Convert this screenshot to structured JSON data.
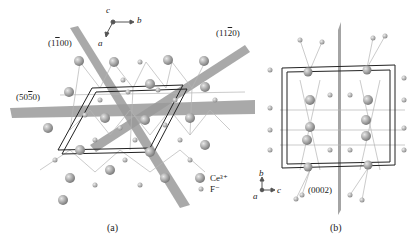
{
  "panel_a": {
    "caption": "(a)",
    "axes": {
      "c": "c",
      "b": "b",
      "a": "a"
    },
    "planes": [
      "(1̅100)",
      "(11̅2̅0)",
      "(505̅0)"
    ],
    "plane_labels": {
      "p1": "(11̅0 0)",
      "p2": "(112̅0)",
      "p3": "(505̅0)"
    },
    "legend": [
      {
        "label": "Ce³⁺",
        "size": "large"
      },
      {
        "label": "F⁻",
        "size": "small"
      }
    ]
  },
  "panel_b": {
    "caption": "(b)",
    "axes": {
      "b": "b",
      "a": "a",
      "c": "c"
    },
    "plane_label": "(0002)"
  },
  "colors": {
    "plane": "#8f8f8f",
    "atom": "#a9a9a9",
    "bond": "#b5b5b5",
    "cell": "#222222"
  }
}
